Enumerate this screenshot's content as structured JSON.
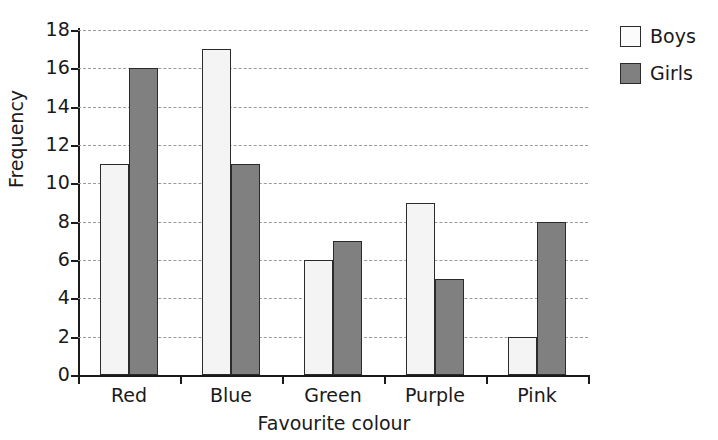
{
  "chart_data": {
    "type": "bar",
    "title": "",
    "xlabel": "Favourite colour",
    "ylabel": "Frequency",
    "categories": [
      "Red",
      "Blue",
      "Green",
      "Purple",
      "Pink"
    ],
    "series": [
      {
        "name": "Boys",
        "values": [
          11,
          17,
          6,
          9,
          2
        ],
        "color": "#f4f4f4"
      },
      {
        "name": "Girls",
        "values": [
          16,
          11,
          7,
          5,
          8
        ],
        "color": "#808080"
      }
    ],
    "ylim": [
      0,
      18
    ],
    "ytick_step": 2,
    "yticks": [
      0,
      2,
      4,
      6,
      8,
      10,
      12,
      14,
      16,
      18
    ],
    "ytick_labels": [
      "0",
      "2",
      "4",
      "6",
      "8",
      "10",
      "12",
      "14",
      "16",
      "18"
    ],
    "grid": "horizontal-dashed",
    "legend_position": "right-top",
    "bar_outline_color": "#2b2b2b",
    "axis_color": "#1a1a1a",
    "gridline_color": "#9a9a9a",
    "background": "#ffffff"
  },
  "legend": {
    "entries": [
      {
        "label": "Boys",
        "swatch": "legend-swatch-boys"
      },
      {
        "label": "Girls",
        "swatch": "legend-swatch-girls"
      }
    ]
  }
}
